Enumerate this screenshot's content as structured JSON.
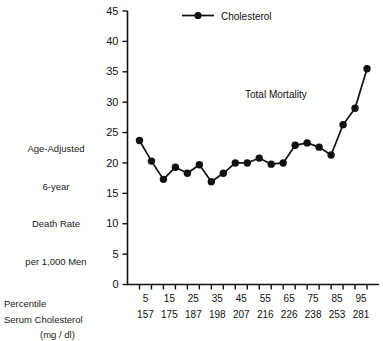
{
  "chart_data": {
    "type": "line",
    "title": "",
    "annotation": "Total Mortality",
    "legend": {
      "entries": [
        "Cholesterol"
      ],
      "position": "top-center"
    },
    "ylabel": "Age-Adjusted 6-year Death Rate per 1,000 Men",
    "ylabel_lines": [
      "Age-Adjusted",
      "6-year",
      "Death Rate",
      "per 1,000 Men"
    ],
    "xlabel_rows": [
      "Percentile",
      "Serum Cholesterol",
      "(mg / dl)"
    ],
    "ylim": [
      0,
      45
    ],
    "yticks": [
      0,
      5,
      10,
      15,
      20,
      25,
      30,
      35,
      40,
      45
    ],
    "ytick_labels": [
      "0",
      "5",
      "10",
      "15",
      "20",
      "25",
      "30",
      "35",
      "40",
      "45"
    ],
    "grid": false,
    "x": [
      1,
      2,
      3,
      4,
      5,
      6,
      7,
      8,
      9,
      10,
      11,
      12,
      13,
      14,
      15,
      16,
      17,
      18,
      19,
      20
    ],
    "percentile_labels": [
      "5",
      "15",
      "25",
      "35",
      "45",
      "55",
      "65",
      "75",
      "85",
      "95"
    ],
    "percentile_positions": [
      1.5,
      3.5,
      5.5,
      7.5,
      9.5,
      11.5,
      13.5,
      15.5,
      17.5,
      19.5
    ],
    "serum_labels": [
      "157",
      "175",
      "187",
      "198",
      "207",
      "216",
      "226",
      "238",
      "253",
      "281"
    ],
    "values": [
      23.7,
      20.3,
      17.3,
      19.3,
      18.3,
      19.7,
      16.9,
      18.3,
      20.0,
      20.0,
      20.8,
      19.8,
      20.0,
      22.9,
      23.3,
      22.6,
      21.3,
      26.3,
      29.0,
      35.5
    ],
    "series": [
      {
        "name": "Cholesterol",
        "values": [
          23.7,
          20.3,
          17.3,
          19.3,
          18.3,
          19.7,
          16.9,
          18.3,
          20.0,
          20.0,
          20.8,
          19.8,
          20.0,
          22.9,
          23.3,
          22.6,
          21.3,
          26.3,
          29.0,
          35.5
        ],
        "color": "#111111",
        "marker": "circle"
      }
    ]
  },
  "colors": {
    "line": "#111111",
    "axis": "#111111",
    "text": "#111111",
    "background": "#ffffff"
  }
}
